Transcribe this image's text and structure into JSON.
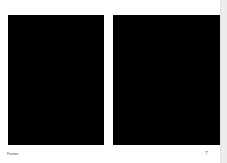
{
  "document": {
    "panels": [
      {
        "name": "left-image",
        "color": "#000000"
      },
      {
        "name": "right-image",
        "color": "#000000"
      }
    ],
    "footer": {
      "label": "Footer",
      "page_number": "7"
    }
  },
  "colors": {
    "background": "#ffffff",
    "panel": "#000000",
    "scrollbar_track": "#ececec"
  }
}
